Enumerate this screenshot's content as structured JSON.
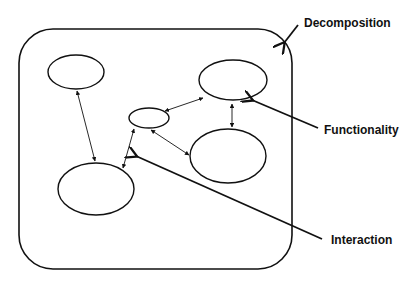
{
  "diagram": {
    "labels": {
      "decomposition": "Decomposition",
      "functionality": "Functionality",
      "interaction": "Interaction"
    },
    "container": {
      "shape": "rounded-rectangle",
      "represents": "system boundary"
    },
    "nodes": [
      {
        "id": "A",
        "position": "top-left"
      },
      {
        "id": "B",
        "position": "center-small"
      },
      {
        "id": "C",
        "position": "top-right"
      },
      {
        "id": "D",
        "position": "right-lower"
      },
      {
        "id": "E",
        "position": "bottom-left"
      }
    ],
    "edges": [
      {
        "from": "A",
        "to": "E",
        "type": "bidirectional"
      },
      {
        "from": "B",
        "to": "E",
        "type": "bidirectional"
      },
      {
        "from": "B",
        "to": "C",
        "type": "bidirectional"
      },
      {
        "from": "B",
        "to": "D",
        "type": "bidirectional"
      },
      {
        "from": "C",
        "to": "D",
        "type": "bidirectional"
      }
    ],
    "callouts": [
      {
        "label": "Decomposition",
        "points_to": "container corner"
      },
      {
        "label": "Functionality",
        "points_to": "node C"
      },
      {
        "label": "Interaction",
        "points_to": "edge B-E"
      }
    ],
    "colors": {
      "stroke": "#111111",
      "background": "#ffffff"
    }
  }
}
